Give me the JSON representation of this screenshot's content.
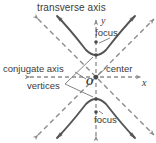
{
  "figure": {
    "title": "transverse axis",
    "labels": {
      "conjugate_axis": "conjugate axis",
      "vertices": "vertices",
      "center": "center",
      "focus_top": "focus",
      "focus_bottom": "focus",
      "y_axis": "y",
      "x_axis": "x",
      "origin": "O"
    },
    "colors": {
      "curve": "#555555",
      "asymptote": "#8c8c8c",
      "axis": "#8c8c8c",
      "text": "#3a3a3a",
      "leader": "#777777",
      "background": "#ffffff"
    },
    "geometry": {
      "center": [
        96,
        77
      ],
      "vertex_top": [
        96,
        55
      ],
      "vertex_bottom": [
        96,
        99
      ],
      "focus_top": [
        96,
        42
      ],
      "focus_bottom": [
        96,
        112
      ],
      "asymptote_slope": 1.0
    }
  }
}
